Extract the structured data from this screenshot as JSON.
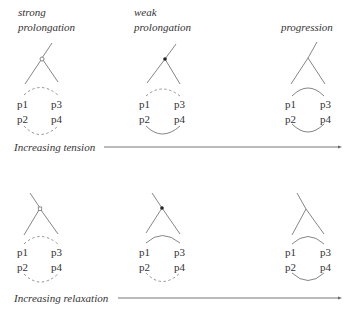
{
  "rows": [
    {
      "axis_label": "Increasing tension",
      "panels": [
        {
          "title_lines": [
            "strong",
            "prolongation"
          ],
          "node_type": "open",
          "tree_orientation": "right-leaning",
          "top_arc": "dashed",
          "bottom_arc": "dashed",
          "labels": [
            "p1",
            "p3",
            "p2",
            "p4"
          ]
        },
        {
          "title_lines": [
            "weak",
            "prolongation"
          ],
          "node_type": "filled",
          "tree_orientation": "right-leaning",
          "top_arc": "dashed",
          "bottom_arc": "solid",
          "labels": [
            "p1",
            "p3",
            "p2",
            "p4"
          ]
        },
        {
          "title_lines": [
            "",
            "progression"
          ],
          "node_type": "none",
          "tree_orientation": "right-leaning",
          "top_arc": "solid",
          "bottom_arc": "solid",
          "labels": [
            "p1",
            "p3",
            "p2",
            "p4"
          ]
        }
      ]
    },
    {
      "axis_label": "Increasing relaxation",
      "panels": [
        {
          "title_lines": [],
          "node_type": "open",
          "tree_orientation": "left-leaning",
          "top_arc": "dashed",
          "bottom_arc": "dashed",
          "labels": [
            "p1",
            "p3",
            "p2",
            "p4"
          ]
        },
        {
          "title_lines": [],
          "node_type": "filled",
          "tree_orientation": "left-leaning",
          "top_arc": "solid",
          "bottom_arc": "dashed",
          "labels": [
            "p1",
            "p3",
            "p2",
            "p4"
          ]
        },
        {
          "title_lines": [],
          "node_type": "none",
          "tree_orientation": "left-leaning",
          "top_arc": "solid",
          "bottom_arc": "solid",
          "labels": [
            "p1",
            "p3",
            "p2",
            "p4"
          ]
        }
      ]
    }
  ]
}
